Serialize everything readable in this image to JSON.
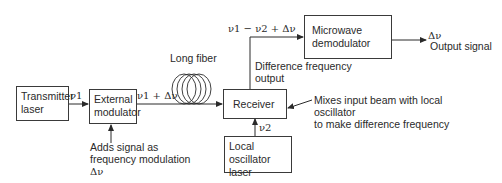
{
  "blocks": {
    "transmitter": {
      "line1": "Transmitter",
      "line2": "laser"
    },
    "modulator": {
      "line1": "External",
      "line2": "modulator"
    },
    "receiver": {
      "label": "Receiver"
    },
    "local_osc": {
      "line1": "Local oscillator",
      "line2": "laser"
    },
    "demodulator": {
      "line1": "Microwave",
      "line2": "demodulator"
    }
  },
  "signals": {
    "nu1": "ν1",
    "nu1_plus": "ν1 + Δν",
    "nu2": "ν2",
    "difference": "ν1 − ν2 + Δν",
    "delta": "Δν"
  },
  "labels": {
    "fiber": "Long fiber",
    "difference_output_1": "Difference frequency",
    "difference_output_2": "output",
    "output_signal": "Output signal",
    "modulation_1": "Adds signal as",
    "modulation_2": "frequency modulation",
    "modulation_3": "Δν",
    "mixer_1": "Mixes input beam with local",
    "mixer_2": "oscillator",
    "mixer_3": "to make difference frequency"
  }
}
